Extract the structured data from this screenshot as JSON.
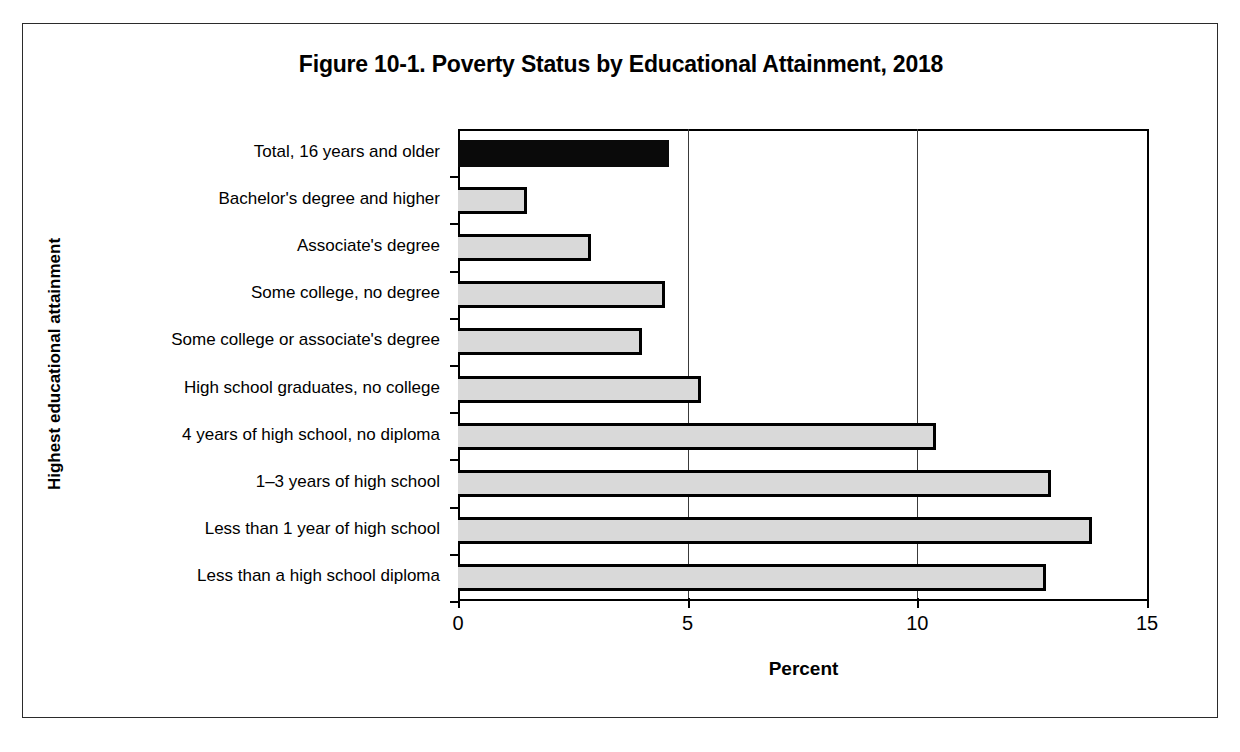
{
  "figure": {
    "title": "Figure 10-1. Poverty Status by Educational Attainment, 2018",
    "y_axis_title": "Highest educational attainment",
    "x_axis_title": "Percent"
  },
  "chart_data": {
    "type": "bar",
    "orientation": "horizontal",
    "title": "Figure 10-1. Poverty Status by Educational Attainment, 2018",
    "xlabel": "Percent",
    "ylabel": "Highest educational attainment",
    "xlim": [
      0,
      15
    ],
    "xticks": [
      0,
      5,
      10,
      15
    ],
    "xtick_labels": [
      "0",
      "5",
      "10",
      "15"
    ],
    "grid": "vertical",
    "legend": "none",
    "categories": [
      "Total, 16 years and older",
      "Bachelor's degree and higher",
      "Associate's degree",
      "Some college, no degree",
      "Some college or associate's degree",
      "High school graduates, no college",
      "4 years of high school, no diploma",
      "1–3 years of high school",
      "Less than 1 year of high school",
      "Less than a high school diploma"
    ],
    "values": [
      4.6,
      1.5,
      2.9,
      4.5,
      4.0,
      5.3,
      10.4,
      12.9,
      13.8,
      12.8
    ],
    "bar_colors": [
      "#0a0a0a",
      "#d9d9d9",
      "#d9d9d9",
      "#d9d9d9",
      "#d9d9d9",
      "#d9d9d9",
      "#d9d9d9",
      "#d9d9d9",
      "#d9d9d9",
      "#d9d9d9"
    ],
    "bar_edge_color": "#000000"
  }
}
